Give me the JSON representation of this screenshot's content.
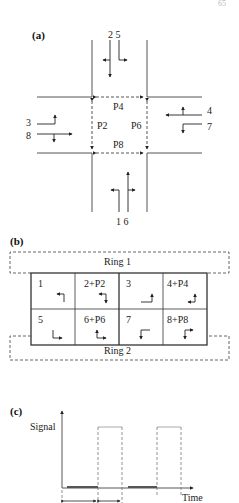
{
  "page_number": "65",
  "panel_a": {
    "label": "(a)",
    "movements": {
      "north": "2 5",
      "south": "1 6",
      "west_top": "3",
      "west_bottom": "8",
      "east_top": "4",
      "east_bottom": "7"
    },
    "pedestrian": {
      "north": "P4",
      "south": "P8",
      "west": "P2",
      "east": "P6"
    }
  },
  "panel_b": {
    "label": "(b)",
    "ring1_label": "Ring 1",
    "ring2_label": "Ring 2",
    "ring1_phases": [
      "1",
      "2+P2",
      "3",
      "4+P4"
    ],
    "ring2_phases": [
      "5",
      "6+P6",
      "7",
      "8+P8"
    ]
  },
  "panel_c": {
    "label": "(c)",
    "y_axis_label": "Signal",
    "x_axis_label": "Time"
  }
}
